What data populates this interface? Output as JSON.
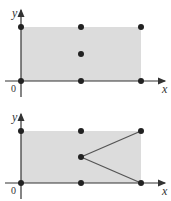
{
  "figure": {
    "panels": [
      {
        "name": "top",
        "axis_labels": {
          "x": "x",
          "y": "y",
          "origin": "0"
        },
        "region": {
          "fill": "#dcdcdc"
        },
        "points": [
          {
            "x": 0,
            "y": 0
          },
          {
            "x": 1,
            "y": 0
          },
          {
            "x": 2,
            "y": 0
          },
          {
            "x": 0,
            "y": 2
          },
          {
            "x": 1,
            "y": 2
          },
          {
            "x": 2,
            "y": 2
          },
          {
            "x": 1,
            "y": 1
          }
        ],
        "segments": []
      },
      {
        "name": "bottom",
        "axis_labels": {
          "x": "x",
          "y": "y",
          "origin": "0"
        },
        "region": {
          "fill": "#dcdcdc"
        },
        "points": [
          {
            "x": 0,
            "y": 0
          },
          {
            "x": 1,
            "y": 0
          },
          {
            "x": 2,
            "y": 0
          },
          {
            "x": 0,
            "y": 2
          },
          {
            "x": 1,
            "y": 2
          },
          {
            "x": 2,
            "y": 2
          },
          {
            "x": 1,
            "y": 1
          }
        ],
        "segments": [
          {
            "from": {
              "x": 1,
              "y": 1
            },
            "to": {
              "x": 2,
              "y": 2
            }
          },
          {
            "from": {
              "x": 1,
              "y": 1
            },
            "to": {
              "x": 2,
              "y": 0
            }
          }
        ]
      }
    ],
    "colors": {
      "axis": "#333333",
      "point": "#222222",
      "line": "#555555",
      "region": "#dcdcdc"
    }
  }
}
